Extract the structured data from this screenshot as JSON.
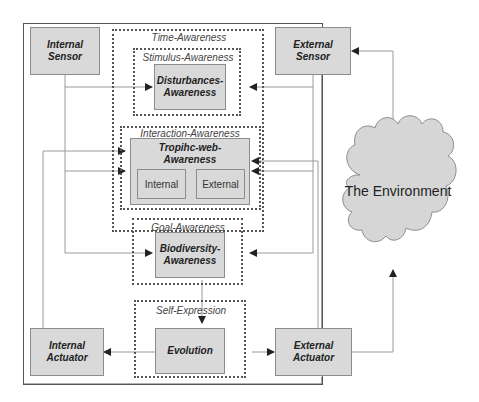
{
  "diagram": {
    "outer_system": "System boundary",
    "sensors": {
      "internal": "Internal Sensor",
      "external": "External Sensor"
    },
    "actuators": {
      "internal": "Internal Actuator",
      "external": "External Actuator"
    },
    "groups": {
      "time_awareness": "Time-Awareness",
      "stimulus_awareness": "Stimulus-Awareness",
      "interaction_awareness": "Interaction-Awareness",
      "goal_awareness": "Goal-Awareness",
      "self_expression": "Self-Expression"
    },
    "nodes": {
      "disturbances": "Disturbances-\nAwareness",
      "disturbances_l1": "Disturbances-",
      "disturbances_l2": "Awareness",
      "trophic_l1": "Tropihc-web-",
      "trophic_l2": "Awareness",
      "trophic_internal": "Internal",
      "trophic_external": "External",
      "biodiversity_l1": "Biodiversity-",
      "biodiversity_l2": "Awareness",
      "evolution": "Evolution"
    },
    "environment": "The Environment",
    "colors": {
      "box_fill": "#d9d9d9",
      "cloud_fill": "#d6d6d6",
      "line": "#8c8c8c",
      "arrow": "#222222"
    }
  }
}
